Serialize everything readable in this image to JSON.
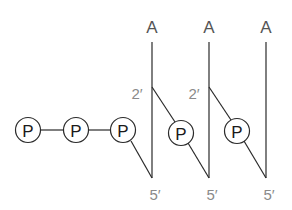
{
  "diagram": {
    "title": "",
    "base_label": "A",
    "phosphate_label": "P",
    "prime_2_label": "2′",
    "prime_5_label": "5′",
    "colors": {
      "line": "#2a2a2a",
      "base_text": "#555555",
      "prime_text": "#8a8a8a",
      "phosphate_text": "#1a1a1a"
    },
    "strands": [
      {
        "base": "A",
        "top_label": "A",
        "prime_2": "2′",
        "prime_5": "5′"
      },
      {
        "base": "A",
        "top_label": "A",
        "prime_2": "2′",
        "prime_5": "5′"
      },
      {
        "base": "A",
        "top_label": "A",
        "prime_5": "5′"
      }
    ],
    "phosphates": [
      {
        "label": "P"
      },
      {
        "label": "P"
      },
      {
        "label": "P"
      },
      {
        "label": "P"
      },
      {
        "label": "P"
      }
    ]
  }
}
